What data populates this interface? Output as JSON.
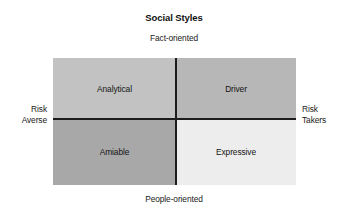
{
  "chart_data": {
    "type": "table",
    "title": "Social Styles",
    "subtype": "2x2-quadrant-matrix",
    "xlabel": "",
    "ylabel": "",
    "grid": false,
    "legend": "none",
    "axes": {
      "top_label": "Fact-oriented",
      "bottom_label": "People-oriented",
      "left_label_line1": "Risk",
      "left_label_line2": "Averse",
      "right_label_line1": "Risk",
      "right_label_line2": "Takers"
    },
    "quadrants": [
      {
        "id": "top-left",
        "label": "Analytical",
        "x_axis_side": "Risk Averse",
        "y_axis_side": "Fact-oriented",
        "fill": "#c2c2c2"
      },
      {
        "id": "top-right",
        "label": "Driver",
        "x_axis_side": "Risk Takers",
        "y_axis_side": "Fact-oriented",
        "fill": "#b7b7b7"
      },
      {
        "id": "bottom-left",
        "label": "Amiable",
        "x_axis_side": "Risk Averse",
        "y_axis_side": "People-oriented",
        "fill": "#a8a8a8"
      },
      {
        "id": "bottom-right",
        "label": "Expressive",
        "x_axis_side": "Risk Takers",
        "y_axis_side": "People-oriented",
        "fill": "#ededed"
      }
    ],
    "colors": {
      "line": "#1c1c1c",
      "text": "#1a1a1a",
      "background": "#ffffff"
    }
  }
}
